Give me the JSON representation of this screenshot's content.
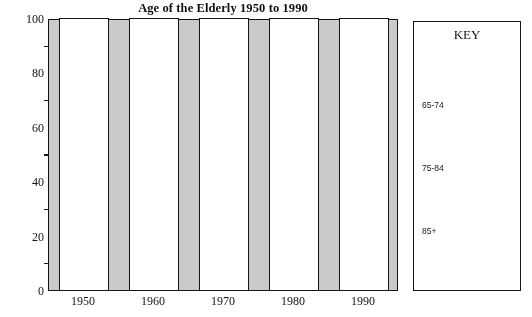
{
  "chart_data": {
    "type": "bar",
    "title": "Age of the Elderly 1950 to 1990",
    "xlabel": "",
    "ylabel": "Percentage",
    "categories": [
      "1950",
      "1960",
      "1970",
      "1980",
      "1990"
    ],
    "values": [
      100,
      100,
      100,
      100,
      100
    ],
    "ylim": [
      0,
      100
    ],
    "ytick_labels": [
      "0",
      "20",
      "40",
      "60",
      "80",
      "100"
    ],
    "ytick_values": [
      0,
      20,
      40,
      60,
      80,
      100
    ],
    "yminor_tick_values": [
      10,
      30,
      50,
      70,
      90
    ],
    "grid": false,
    "legend_position": "right",
    "legend_title": "KEY",
    "legend_entries": [
      {
        "label": "65-74"
      },
      {
        "label": "75-84"
      },
      {
        "label": "85+"
      }
    ],
    "series": [
      {
        "name": "Total",
        "values": [
          100,
          100,
          100,
          100,
          100
        ]
      }
    ],
    "colors": {
      "plot_background": "#c9c9c9",
      "bar_fill": "#ffffff",
      "bar_outline": "#171717",
      "axis": "#161616",
      "text": "#151515"
    }
  }
}
